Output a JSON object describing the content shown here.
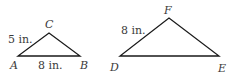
{
  "figure": {
    "stroke_color": "#1a1a1a",
    "label_color": "#3a3a3a",
    "triangles": [
      {
        "name": "ABC",
        "vertices": {
          "A": {
            "label": "A",
            "x": 18,
            "y": 56
          },
          "B": {
            "label": "B",
            "x": 80,
            "y": 56
          },
          "C": {
            "label": "C",
            "x": 49,
            "y": 33
          }
        },
        "side_labels": {
          "AC": "5 in.",
          "AB": "8 in."
        }
      },
      {
        "name": "DEF",
        "vertices": {
          "D": {
            "label": "D",
            "x": 120,
            "y": 56
          },
          "E": {
            "label": "E",
            "x": 219,
            "y": 56
          },
          "F": {
            "label": "F",
            "x": 169,
            "y": 18
          }
        },
        "side_labels": {
          "DF": "8 in."
        }
      }
    ]
  }
}
